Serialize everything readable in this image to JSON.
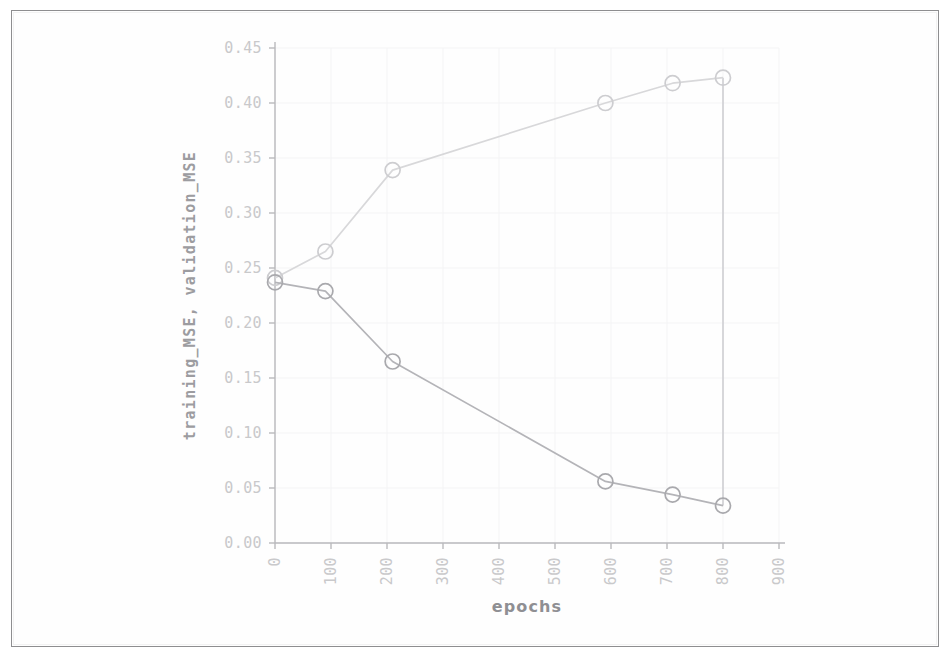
{
  "figure": {
    "background_color": "#ffffff",
    "frame_color": "#8e8e90"
  },
  "chart_data": {
    "type": "line",
    "title": "",
    "subtitle": "",
    "xlabel": "epochs",
    "ylabel": "training_MSE, validation_MSE",
    "xlim": [
      0,
      900
    ],
    "ylim": [
      0.0,
      0.45
    ],
    "xticks": [
      0,
      100,
      200,
      300,
      400,
      500,
      600,
      700,
      800,
      900
    ],
    "xtick_labels": [
      "0",
      "100",
      "200",
      "300",
      "400",
      "500",
      "600",
      "700",
      "800",
      "900"
    ],
    "xtick_rotation": 90,
    "yticks": [
      0.0,
      0.05,
      0.1,
      0.15,
      0.2,
      0.25,
      0.3,
      0.35,
      0.4,
      0.45
    ],
    "ytick_labels": [
      "0.00",
      "0.05",
      "0.10",
      "0.15",
      "0.20",
      "0.25",
      "0.30",
      "0.35",
      "0.40",
      "0.45"
    ],
    "grid": true,
    "grid_color": "#f4f4f5",
    "legend": false,
    "legend_position": "none",
    "marker": "circle-open",
    "series": [
      {
        "name": "validation_MSE",
        "color": "#d8d8da",
        "marker_color": "#cdcdd0",
        "x": [
          0,
          90,
          210,
          590,
          710,
          800
        ],
        "y": [
          0.241,
          0.265,
          0.339,
          0.4,
          0.418,
          0.423
        ]
      },
      {
        "name": "training_MSE",
        "color": "#b4b4b8",
        "marker_color": "#a9a9ad",
        "x": [
          0,
          90,
          210,
          590,
          710,
          800
        ],
        "y": [
          0.237,
          0.229,
          0.165,
          0.056,
          0.044,
          0.034
        ]
      }
    ],
    "annotations": [
      {
        "name": "terminal-vertical-connector",
        "x": 800,
        "y_from": 0.423,
        "y_to": 0.034,
        "color": "#cfcfd2"
      }
    ]
  }
}
